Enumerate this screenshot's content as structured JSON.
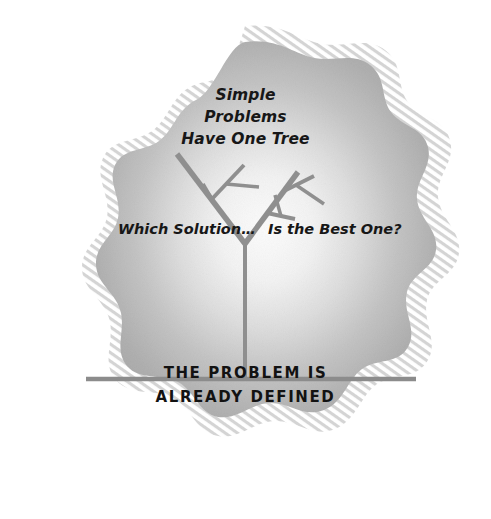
{
  "figure": {
    "name": "simple-problems-have-one-tree-diagram",
    "background_color": "#ffffff",
    "blob": {
      "shape": "scalloped-cloud",
      "fill_center_color": "#fdfdfd",
      "fill_edge_color": "#a9a9a9",
      "texture_ring_color": "#d6d6d6",
      "center_x": 245,
      "center_y": 258
    }
  },
  "headline": {
    "lines": [
      "Simple",
      "Problems",
      "Have One Tree"
    ]
  },
  "labels": {
    "left": "Which Solution…",
    "right": "Is the Best One?"
  },
  "footer": {
    "lines": [
      "THE PROBLEM IS",
      "ALREADY DEFINED"
    ]
  },
  "ground_line": {
    "color": "#8c8c8c",
    "x_start": 86,
    "x_end": 416,
    "y": 379,
    "thickness": 4
  },
  "tree": {
    "stroke_color": "#8f8f8f",
    "trunk": {
      "from_x": 245,
      "from_y": 379,
      "to_x": 245,
      "to_y": 243,
      "width": 4
    },
    "branches": [
      {
        "name": "left-main",
        "from_x": 245,
        "from_y": 243,
        "to_x": 178,
        "to_y": 155,
        "width": 5
      },
      {
        "name": "right-main",
        "from_x": 245,
        "from_y": 243,
        "to_x": 297,
        "to_y": 173,
        "width": 5
      },
      {
        "name": "left-upper-fork",
        "from_x": 213,
        "from_y": 197,
        "to_x": 243,
        "to_y": 166,
        "width": 4
      },
      {
        "name": "left-upper-twig",
        "from_x": 228,
        "from_y": 182,
        "to_x": 258,
        "to_y": 186,
        "width": 3
      },
      {
        "name": "left-lower-twig",
        "from_x": 205,
        "from_y": 186,
        "to_x": 214,
        "to_y": 201,
        "width": 3
      },
      {
        "name": "right-upper-fork",
        "from_x": 283,
        "from_y": 192,
        "to_x": 313,
        "to_y": 177,
        "width": 4
      },
      {
        "name": "right-upper-twig",
        "from_x": 298,
        "from_y": 185,
        "to_x": 323,
        "to_y": 203,
        "width": 3
      },
      {
        "name": "right-lower-fork",
        "from_x": 268,
        "from_y": 212,
        "to_x": 294,
        "to_y": 218,
        "width": 4
      },
      {
        "name": "right-lower-twig",
        "from_x": 281,
        "from_y": 215,
        "to_x": 276,
        "to_y": 196,
        "width": 3
      }
    ]
  }
}
